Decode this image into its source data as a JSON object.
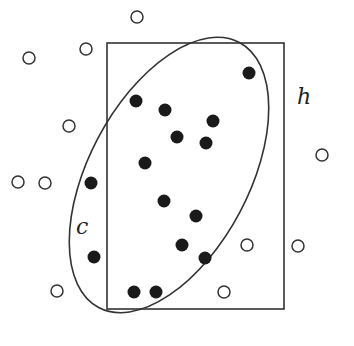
{
  "diagram": {
    "title": "",
    "labels": {
      "hypothesis": "h",
      "concept": "c"
    },
    "colors": {
      "stroke": "#333333",
      "filled": "#1a1a1a",
      "background": "#ffffff"
    },
    "rectangle": {
      "x": 107,
      "y": 43,
      "width": 177,
      "height": 266,
      "label": "h"
    },
    "ellipse": {
      "cx": 169,
      "cy": 175,
      "rx": 150,
      "ry": 80,
      "rotation_deg": -62,
      "label": "c"
    },
    "positive_points": [
      [
        249,
        73
      ],
      [
        136,
        101
      ],
      [
        165,
        110
      ],
      [
        213,
        121
      ],
      [
        177,
        137
      ],
      [
        206,
        143
      ],
      [
        145,
        163
      ],
      [
        91,
        183
      ],
      [
        164,
        201
      ],
      [
        196,
        216
      ],
      [
        182,
        245
      ],
      [
        205,
        258
      ],
      [
        94,
        257
      ],
      [
        134,
        292
      ],
      [
        156,
        292
      ]
    ],
    "negative_points": [
      [
        137,
        17
      ],
      [
        86,
        49
      ],
      [
        29,
        58
      ],
      [
        69,
        126
      ],
      [
        322,
        155
      ],
      [
        18,
        182
      ],
      [
        45,
        183
      ],
      [
        247,
        245
      ],
      [
        298,
        246
      ],
      [
        57,
        291
      ],
      [
        224,
        292
      ]
    ]
  }
}
